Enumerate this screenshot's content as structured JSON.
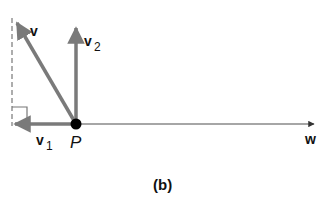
{
  "diagram": {
    "caption": "(b)",
    "point": {
      "label": "P",
      "x": 76,
      "y": 124
    },
    "vectors": [
      {
        "name": "v",
        "label": "v",
        "subscript": "",
        "from": [
          76,
          124
        ],
        "to": [
          16,
          22
        ]
      },
      {
        "name": "v2",
        "label": "v",
        "subscript": "2",
        "from": [
          76,
          124
        ],
        "to": [
          76,
          28
        ]
      },
      {
        "name": "v1",
        "label": "v",
        "subscript": "1",
        "from": [
          76,
          124
        ],
        "to": [
          14,
          124
        ]
      },
      {
        "name": "w",
        "label": "w",
        "subscript": "",
        "from": [
          76,
          124
        ],
        "to": [
          314,
          124
        ]
      }
    ],
    "colors": {
      "vector": "#7a7a7a",
      "line": "#888888",
      "point": "#000000",
      "text": "#111111"
    }
  }
}
